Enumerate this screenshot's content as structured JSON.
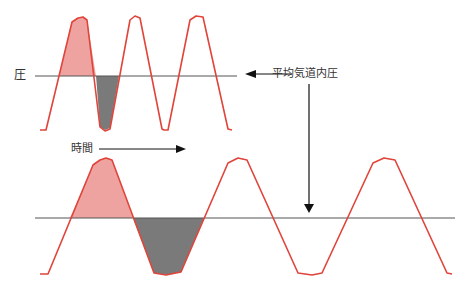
{
  "diagram": {
    "labels": {
      "pressure": "圧",
      "mean_airway_pressure": "平均気道内圧",
      "time": "時間"
    },
    "colors": {
      "waveform": "#e0443a",
      "positive_fill": "#eea3a0",
      "negative_fill": "#7a7a7a",
      "baseline": "#555555",
      "arrow": "#111111",
      "text": "#333333"
    },
    "panels": [
      {
        "name": "top-waveform",
        "description": "higher frequency pressure waveform",
        "cycles": 3
      },
      {
        "name": "bottom-waveform",
        "description": "lower frequency pressure waveform",
        "cycles": 2.5
      }
    ]
  }
}
